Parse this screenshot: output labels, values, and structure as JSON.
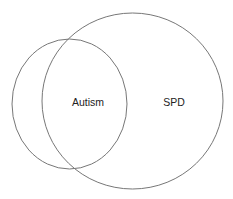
{
  "diagram": {
    "type": "venn",
    "stroke_color": "#777777",
    "background": "#ffffff",
    "sets": [
      {
        "id": "autism",
        "label": "Autism",
        "cx": 69.5,
        "cy": 104,
        "rx": 57.5,
        "ry": 65,
        "label_x": 88,
        "label_y": 106
      },
      {
        "id": "spd",
        "label": "SPD",
        "cx": 132.5,
        "cy": 101,
        "rx": 90.5,
        "ry": 88,
        "label_x": 174,
        "label_y": 106
      }
    ]
  }
}
